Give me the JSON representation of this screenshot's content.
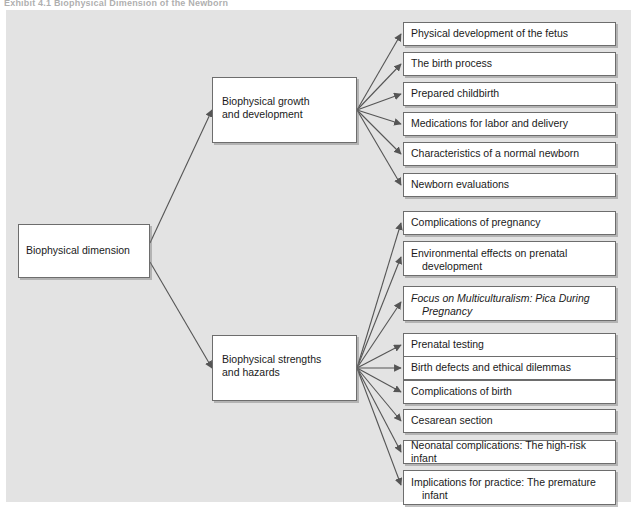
{
  "caption": "Exhibit 4.1   Biophysical Dimension of the Newborn",
  "diagram": {
    "type": "tree-diagram",
    "colors": {
      "panel_background": "#e3e3e3",
      "node_background": "#ffffff",
      "node_border": "#6d6d6d",
      "connector": "#555555",
      "text": "#1a1a1a"
    },
    "root": {
      "label": "Biophysical dimension"
    },
    "branches": [
      {
        "id": "growth",
        "label_line1": "Biophysical growth",
        "label_line2": "and development",
        "children": [
          {
            "line1": "Physical development of the fetus",
            "line2": "",
            "italic": false
          },
          {
            "line1": "The birth process",
            "line2": "",
            "italic": false
          },
          {
            "line1": "Prepared childbirth",
            "line2": "",
            "italic": false
          },
          {
            "line1": "Medications for labor and delivery",
            "line2": "",
            "italic": false
          },
          {
            "line1": "Characteristics of a normal newborn",
            "line2": "",
            "italic": false
          },
          {
            "line1": "Newborn evaluations",
            "line2": "",
            "italic": false
          }
        ]
      },
      {
        "id": "strengths",
        "label_line1": "Biophysical strengths",
        "label_line2": "and hazards",
        "children": [
          {
            "line1": "Complications of pregnancy",
            "line2": "",
            "italic": false
          },
          {
            "line1": "Environmental effects on prenatal",
            "line2": "development",
            "italic": false
          },
          {
            "line1": "Focus on Multiculturalism: Pica During",
            "line2": "Pregnancy",
            "italic": true
          },
          {
            "line1": "Prenatal testing",
            "line2": "",
            "italic": false
          },
          {
            "line1": "Birth defects and ethical dilemmas",
            "line2": "",
            "italic": false
          },
          {
            "line1": "Complications of birth",
            "line2": "",
            "italic": false
          },
          {
            "line1": "Cesarean section",
            "line2": "",
            "italic": false
          },
          {
            "line1": "Neonatal complications: The high-risk infant",
            "line2": "",
            "italic": false
          },
          {
            "line1": "Implications for practice: The premature",
            "line2": "infant",
            "italic": false
          }
        ]
      }
    ]
  }
}
